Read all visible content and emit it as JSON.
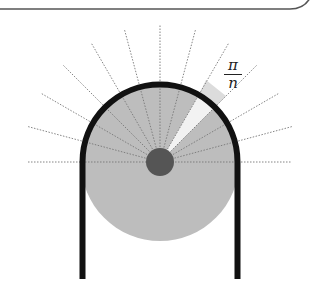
{
  "diagram": {
    "label": {
      "numerator": "π",
      "denominator": "n"
    },
    "colors": {
      "frame": "#555555",
      "disk": "#bdbdbd",
      "hub": "#555555",
      "wall": "#111111",
      "wedge": "#f2f2f2",
      "rays": "#777777"
    },
    "center": [
      160,
      162
    ],
    "disk_radius": 79,
    "hub_radius": 14,
    "ray_length": 137,
    "ray_step_degrees": 15,
    "highlighted_wedge_degrees": [
      45,
      60
    ],
    "wall_bottom_y": 279
  }
}
